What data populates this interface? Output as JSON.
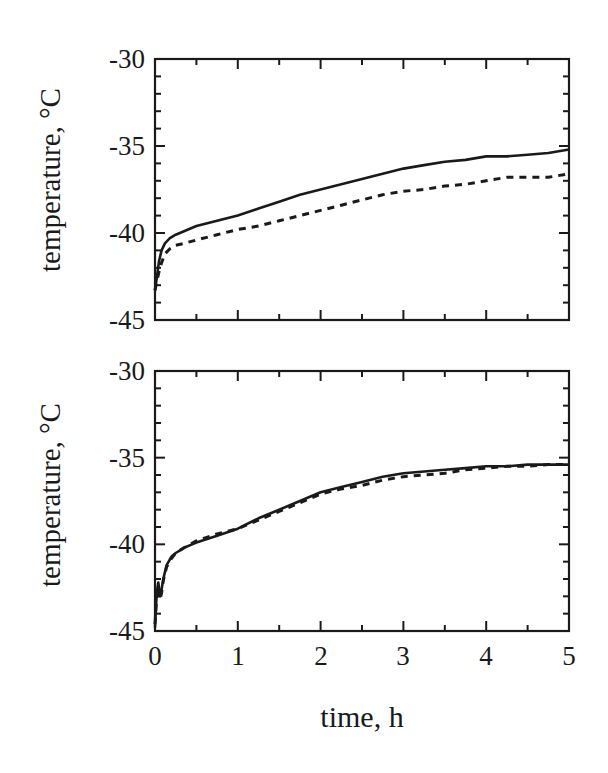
{
  "chart_data": [
    {
      "type": "line",
      "panel": "top",
      "title": "",
      "xlabel": "",
      "ylabel": "temperature, °C",
      "xlim": [
        0,
        5
      ],
      "ylim": [
        -45,
        -30
      ],
      "yticks": [
        -30,
        -35,
        -40,
        -45
      ],
      "ytick_labels": [
        "-30",
        "-35",
        "-40",
        "-45"
      ],
      "xticks": [
        0,
        1,
        2,
        3,
        4,
        5
      ],
      "xtick_labels": [],
      "grid": false,
      "legend": null,
      "series": [
        {
          "name": "solid",
          "style": "solid",
          "x": [
            0.0,
            0.02,
            0.05,
            0.08,
            0.12,
            0.18,
            0.25,
            0.35,
            0.5,
            0.75,
            1.0,
            1.25,
            1.5,
            1.75,
            2.0,
            2.25,
            2.5,
            2.75,
            3.0,
            3.25,
            3.5,
            3.75,
            4.0,
            4.25,
            4.5,
            4.75,
            5.0
          ],
          "y": [
            -43.3,
            -42.6,
            -41.6,
            -41.0,
            -40.6,
            -40.3,
            -40.1,
            -39.9,
            -39.6,
            -39.3,
            -39.0,
            -38.6,
            -38.2,
            -37.8,
            -37.5,
            -37.2,
            -36.9,
            -36.6,
            -36.3,
            -36.1,
            -35.9,
            -35.8,
            -35.6,
            -35.6,
            -35.5,
            -35.4,
            -35.2
          ]
        },
        {
          "name": "dashed",
          "style": "dashed",
          "x": [
            0.0,
            0.02,
            0.05,
            0.08,
            0.12,
            0.18,
            0.25,
            0.35,
            0.5,
            0.75,
            1.0,
            1.25,
            1.5,
            1.75,
            2.0,
            2.25,
            2.5,
            2.75,
            3.0,
            3.25,
            3.5,
            3.75,
            4.0,
            4.25,
            4.5,
            4.75,
            5.0
          ],
          "y": [
            -43.3,
            -42.8,
            -42.2,
            -41.7,
            -41.2,
            -40.9,
            -40.7,
            -40.6,
            -40.4,
            -40.1,
            -39.8,
            -39.6,
            -39.3,
            -39.0,
            -38.7,
            -38.4,
            -38.1,
            -37.8,
            -37.6,
            -37.5,
            -37.3,
            -37.2,
            -37.0,
            -36.8,
            -36.8,
            -36.8,
            -36.6
          ]
        }
      ]
    },
    {
      "type": "line",
      "panel": "bottom",
      "title": "",
      "xlabel": "time, h",
      "ylabel": "temperature, °C",
      "xlim": [
        0,
        5
      ],
      "ylim": [
        -45,
        -30
      ],
      "yticks": [
        -30,
        -35,
        -40,
        -45
      ],
      "ytick_labels": [
        "-30",
        "-35",
        "-40",
        "-45"
      ],
      "xticks": [
        0,
        1,
        2,
        3,
        4,
        5
      ],
      "xtick_labels": [
        "0",
        "1",
        "2",
        "3",
        "4",
        "5"
      ],
      "grid": false,
      "legend": null,
      "series": [
        {
          "name": "solid",
          "style": "solid",
          "x": [
            0.0,
            0.02,
            0.04,
            0.06,
            0.08,
            0.1,
            0.14,
            0.2,
            0.25,
            0.35,
            0.5,
            0.75,
            1.0,
            1.25,
            1.5,
            1.75,
            2.0,
            2.25,
            2.5,
            2.75,
            3.0,
            3.25,
            3.5,
            3.75,
            4.0,
            4.25,
            4.5,
            4.75,
            5.0
          ],
          "y": [
            -44.8,
            -42.8,
            -42.2,
            -43.0,
            -42.6,
            -42.0,
            -41.2,
            -40.7,
            -40.5,
            -40.2,
            -39.9,
            -39.5,
            -39.1,
            -38.5,
            -38.0,
            -37.5,
            -37.0,
            -36.7,
            -36.4,
            -36.1,
            -35.9,
            -35.8,
            -35.7,
            -35.6,
            -35.5,
            -35.5,
            -35.4,
            -35.4,
            -35.4
          ]
        },
        {
          "name": "dashed",
          "style": "dashed",
          "x": [
            0.0,
            0.02,
            0.04,
            0.06,
            0.08,
            0.1,
            0.14,
            0.2,
            0.25,
            0.35,
            0.5,
            0.75,
            1.0,
            1.25,
            1.5,
            1.75,
            2.0,
            2.25,
            2.5,
            2.75,
            3.0,
            3.25,
            3.5,
            3.75,
            4.0,
            4.25,
            4.5,
            4.75,
            5.0
          ],
          "y": [
            -44.6,
            -43.0,
            -42.5,
            -43.2,
            -42.8,
            -42.1,
            -41.3,
            -40.8,
            -40.5,
            -40.2,
            -39.8,
            -39.4,
            -39.1,
            -38.6,
            -38.1,
            -37.6,
            -37.1,
            -36.8,
            -36.6,
            -36.3,
            -36.1,
            -36.0,
            -35.9,
            -35.7,
            -35.6,
            -35.5,
            -35.5,
            -35.4,
            -35.4
          ]
        }
      ]
    }
  ],
  "figure": {
    "top_panel": {
      "ylabel": "temperature, °C",
      "ytick_labels": [
        "-30",
        "-35",
        "-40",
        "-45"
      ]
    },
    "bottom_panel": {
      "ylabel": "temperature, °C",
      "ytick_labels": [
        "-30",
        "-35",
        "-40",
        "-45"
      ],
      "xtick_labels": [
        "0",
        "1",
        "2",
        "3",
        "4",
        "5"
      ],
      "xlabel": "time, h"
    },
    "colors": {
      "line": "#1a1a1a",
      "frame": "#1a1a1a",
      "background": "#ffffff"
    }
  }
}
